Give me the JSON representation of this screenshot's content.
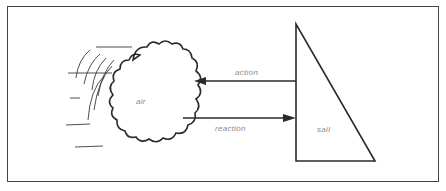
{
  "diagram": {
    "labels": {
      "air": "air",
      "sail": "sail",
      "action": "action",
      "reaction": "reaction"
    },
    "colors": {
      "line": "#2a2a2a",
      "text": "#8a8a8a",
      "frame": "#444444"
    }
  }
}
